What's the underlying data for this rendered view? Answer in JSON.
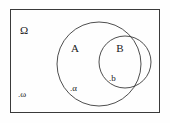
{
  "figure": {
    "kind": "set-venn-diagram",
    "background_color": "#fefefe",
    "stroke_color": "#3a3a3a",
    "text_color": "#1a1a1a"
  },
  "universe": {
    "label": "Ω",
    "name": "sample-space",
    "rect": {
      "x": 10,
      "y": 9,
      "width": 150,
      "height": 104
    },
    "label_pos": {
      "x": 20,
      "y": 34
    }
  },
  "sets": [
    {
      "label": "A",
      "name": "set-a",
      "shape": "circle",
      "cx": 99,
      "cy": 64,
      "r": 42,
      "label_pos": {
        "x": 75,
        "y": 52
      }
    },
    {
      "label": "B",
      "name": "set-b",
      "shape": "circle",
      "cx": 125,
      "cy": 62,
      "r": 26,
      "label_pos": {
        "x": 119,
        "y": 52
      }
    }
  ],
  "points": [
    {
      "label": ".α",
      "name": "point-alpha",
      "in": "A",
      "dot": {
        "cx": 74,
        "cy": 86
      },
      "label_pos": {
        "x": 71,
        "y": 90
      }
    },
    {
      "label": ".b",
      "name": "point-b",
      "in": "B",
      "dot": {
        "cx": 112,
        "cy": 76
      },
      "label_pos": {
        "x": 110,
        "y": 80
      }
    },
    {
      "label": ".ω",
      "name": "point-omega",
      "in": "Ω",
      "dot": {
        "cx": 22,
        "cy": 92
      },
      "label_pos": {
        "x": 19,
        "y": 96
      }
    }
  ]
}
